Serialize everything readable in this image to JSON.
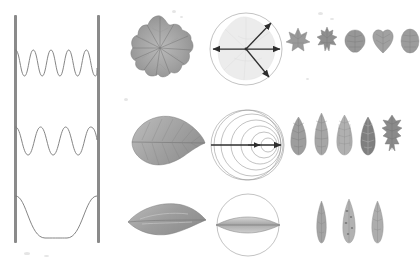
{
  "figure": {
    "background_color": "#ffffff",
    "ink_color": "#4a4a4a",
    "wall_color": "#8a8a8a",
    "curve_color": "#777777",
    "rows": 3,
    "columns": 4
  },
  "wave_panel": {
    "label": "standing-wave-modes",
    "wall_left_label": "fixed end",
    "wall_right_label": "fixed end",
    "modes": [
      {
        "name": "mode-3",
        "harmonic": 3,
        "half_wavelengths": 3,
        "antinodes": 3,
        "nodes": 4,
        "amplitude": 26,
        "baseline_y": 76
      },
      {
        "name": "mode-2",
        "harmonic": 2,
        "half_wavelengths": 2,
        "antinodes": 2,
        "nodes": 3,
        "amplitude": 28,
        "baseline_y": 155
      },
      {
        "name": "mode-1",
        "harmonic": 1,
        "half_wavelengths": 1,
        "antinodes": 1,
        "nodes": 2,
        "amplitude": 30,
        "baseline_y": 206
      }
    ]
  },
  "specimens": [
    {
      "name": "palmate-round-leaf",
      "shape": "orbicular-palmate",
      "row": 1
    },
    {
      "name": "ovate-serrate-leaf",
      "shape": "ovate-acuminate",
      "row": 2
    },
    {
      "name": "lanceolate-leaf",
      "shape": "linear-lanceolate",
      "row": 3
    }
  ],
  "diagrams": [
    {
      "name": "radial-vector-diagram",
      "row": 1,
      "type": "radial-arrows",
      "arrow_count": 4,
      "arrows": [
        {
          "name": "arrow-east",
          "angle_deg": 0
        },
        {
          "name": "arrow-northeast",
          "angle_deg": 45
        },
        {
          "name": "arrow-southeast",
          "angle_deg": -45
        },
        {
          "name": "arrow-west",
          "angle_deg": 180
        }
      ],
      "circle_radius": 36
    },
    {
      "name": "wavefront-convergence-diagram",
      "row": 2,
      "type": "concentric-arcs",
      "arc_count": 6,
      "axis_arrow": "arrow-east",
      "circle_radius": 36
    },
    {
      "name": "lens-cross-section-diagram",
      "row": 3,
      "type": "lenticular-section",
      "circle_radius": 34
    }
  ],
  "leaf_series": [
    {
      "name": "broad-leaf-series",
      "row": 1,
      "count": 5,
      "items": [
        {
          "name": "leaf-palmate-lobed",
          "shape": "palmate-lobed"
        },
        {
          "name": "leaf-palmate-serrate",
          "shape": "palmate-serrate"
        },
        {
          "name": "leaf-crenate-round",
          "shape": "crenate-orbicular"
        },
        {
          "name": "leaf-cordate",
          "shape": "cordate"
        },
        {
          "name": "leaf-orbicular",
          "shape": "orbicular"
        }
      ]
    },
    {
      "name": "elongate-leaf-series",
      "row": 2,
      "count": 5,
      "items": [
        {
          "name": "leaf-elliptic-veined",
          "shape": "elliptic"
        },
        {
          "name": "leaf-lanceolate-acute",
          "shape": "lanceolate"
        },
        {
          "name": "leaf-elliptic-reticulate",
          "shape": "elliptic-reticulate"
        },
        {
          "name": "leaf-ovate-dark",
          "shape": "ovate"
        },
        {
          "name": "leaf-lobed-pinnatifid",
          "shape": "pinnatifid"
        }
      ]
    },
    {
      "name": "narrow-leaf-series",
      "row": 3,
      "count": 3,
      "items": [
        {
          "name": "leaf-linear-slim",
          "shape": "linear"
        },
        {
          "name": "leaf-linear-mottled",
          "shape": "linear-mottled"
        },
        {
          "name": "leaf-oblanceolate",
          "shape": "oblanceolate"
        }
      ]
    }
  ]
}
